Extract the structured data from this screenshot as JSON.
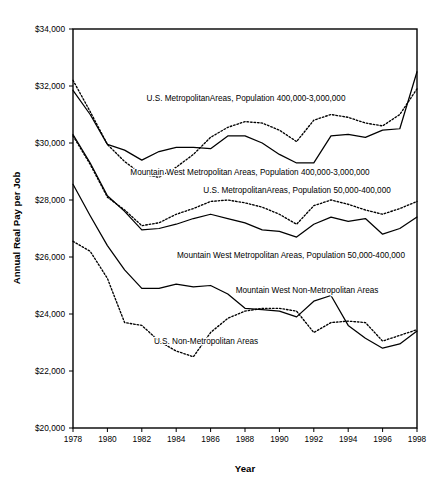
{
  "chart_data": {
    "type": "line",
    "title": "",
    "xlabel": "Year",
    "ylabel": "Annual Real Pay per Job",
    "xlim": [
      1978,
      1998
    ],
    "ylim": [
      20000,
      34000
    ],
    "grid": false,
    "legend_position": "inline-annotations",
    "x": [
      1978,
      1979,
      1980,
      1981,
      1982,
      1983,
      1984,
      1985,
      1986,
      1987,
      1988,
      1989,
      1990,
      1991,
      1992,
      1993,
      1994,
      1995,
      1996,
      1997,
      1998
    ],
    "y_ticks": [
      20000,
      22000,
      24000,
      26000,
      28000,
      30000,
      32000,
      34000
    ],
    "y_tick_labels": [
      "$20,000",
      "$22,000",
      "$24,000",
      "$26,000",
      "$28,000",
      "$30,000",
      "$32,000",
      "$34,000"
    ],
    "x_ticks": [
      1978,
      1980,
      1982,
      1984,
      1986,
      1988,
      1990,
      1992,
      1994,
      1996,
      1998
    ],
    "x_tick_labels": [
      "1978",
      "1980",
      "1982",
      "1984",
      "1986",
      "1988",
      "1990",
      "1992",
      "1994",
      "1996",
      "1998"
    ],
    "series": [
      {
        "name": "U.S. MetropolitanAreas, Population 400,000-3,000,000",
        "style": "dotted",
        "values": [
          32200,
          31100,
          29950,
          29350,
          28900,
          28800,
          29150,
          29600,
          30200,
          30550,
          30750,
          30700,
          30450,
          30050,
          30800,
          31000,
          30900,
          30700,
          30600,
          31000,
          31900
        ]
      },
      {
        "name": "Mountain West Metropolitan Areas, Population 400,000-3,000,000",
        "style": "solid",
        "values": [
          31850,
          31000,
          29950,
          29750,
          29400,
          29700,
          29850,
          29850,
          29800,
          30250,
          30250,
          30000,
          29600,
          29300,
          29300,
          30250,
          30300,
          30200,
          30450,
          30500,
          32500
        ]
      },
      {
        "name": "U.S. MetropolitanAreas, Population 50,000-400,000",
        "style": "dotted",
        "values": [
          30250,
          29250,
          28100,
          27650,
          27100,
          27200,
          27500,
          27700,
          27950,
          28000,
          27900,
          27750,
          27500,
          27150,
          27800,
          28000,
          27850,
          27650,
          27500,
          27700,
          27950
        ]
      },
      {
        "name": "Mountain West  Metropolitan Areas, Population 50,000-400,000",
        "style": "solid",
        "values": [
          30300,
          29300,
          28150,
          27600,
          26950,
          27000,
          27150,
          27350,
          27500,
          27350,
          27200,
          26950,
          26900,
          26700,
          27150,
          27400,
          27250,
          27350,
          26800,
          27000,
          27400
        ]
      },
      {
        "name": "Mountain West Non-Metropolitan Areas",
        "style": "solid",
        "values": [
          28550,
          27450,
          26400,
          25550,
          24900,
          24900,
          25050,
          24950,
          25000,
          24700,
          24200,
          24150,
          24100,
          23900,
          24450,
          24650,
          23600,
          23150,
          22800,
          22950,
          23400
        ]
      },
      {
        "name": "U.S. Non-Metropolitan Areas",
        "style": "dotted",
        "values": [
          26550,
          26200,
          25250,
          23700,
          23600,
          23050,
          22700,
          22500,
          23350,
          23850,
          24100,
          24200,
          24200,
          24100,
          23350,
          23700,
          23750,
          23700,
          23050,
          23250,
          23450
        ]
      }
    ],
    "annotations": [
      {
        "text": "U.S. MetropolitanAreas, Population 400,000-3,000,000",
        "x": 246,
        "y": 101,
        "anchor": "middle"
      },
      {
        "text": "Mountain West Metropolitan Areas, Population 400,000-3,000,000",
        "x": 250,
        "y": 175,
        "anchor": "middle"
      },
      {
        "text": "U.S. MetropolitanAreas, Population 50,000-400,000",
        "x": 297,
        "y": 193,
        "anchor": "middle"
      },
      {
        "text": "Mountain West  Metropolitan Areas, Population 50,000-400,000",
        "x": 291,
        "y": 258,
        "anchor": "middle"
      },
      {
        "text": "Mountain West Non-Metropolitan Areas",
        "x": 307,
        "y": 293,
        "anchor": "middle"
      },
      {
        "text": "U.S. Non-Metropolitan Areas",
        "x": 206,
        "y": 344,
        "anchor": "middle"
      }
    ]
  },
  "plot": {
    "left": 73,
    "right": 417,
    "top": 29,
    "bottom": 428
  },
  "colors": {
    "ink": "#000000",
    "background": "#ffffff"
  }
}
